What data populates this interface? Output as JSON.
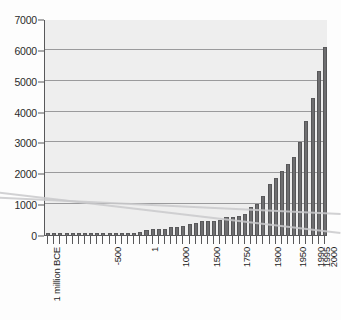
{
  "chart_data": {
    "type": "bar",
    "title": "",
    "subtitle": "",
    "xlabel": "",
    "ylabel": "",
    "ylim": [
      0,
      7000
    ],
    "ytick_labels": [
      "0",
      "1000",
      "2000",
      "3000",
      "4000",
      "5000",
      "6000",
      "7000"
    ],
    "ytick_values": [
      0,
      1000,
      2000,
      3000,
      4000,
      5000,
      6000,
      7000
    ],
    "grid": true,
    "legend": "none",
    "categories": [
      "1 million BCE",
      "",
      "",
      "",
      "",
      "",
      "",
      "",
      "",
      "",
      "-500",
      "",
      "",
      "",
      "",
      "",
      "1",
      "",
      "",
      "",
      "1000",
      "",
      "",
      "",
      "1500",
      "",
      "",
      "",
      "1750",
      "",
      "",
      "",
      "",
      "1900",
      "",
      "",
      "1950",
      "",
      "",
      "",
      "",
      "",
      "",
      "1990",
      "1995",
      "2000"
    ],
    "values": [
      10,
      10,
      10,
      10,
      10,
      12,
      14,
      16,
      20,
      25,
      30,
      40,
      50,
      60,
      70,
      90,
      170,
      190,
      190,
      200,
      250,
      260,
      300,
      360,
      400,
      460,
      460,
      460,
      500,
      580,
      600,
      630,
      690,
      900,
      1000,
      1260,
      1650,
      1860,
      2070,
      2300,
      2520,
      3020,
      3700,
      4450,
      5300,
      6100
    ],
    "labeled_ticks": [
      {
        "index": 0,
        "label": "1 million BCE"
      },
      {
        "index": 10,
        "label": "-500"
      },
      {
        "index": 16,
        "label": "1"
      },
      {
        "index": 21,
        "label": "1000"
      },
      {
        "index": 26,
        "label": "1500"
      },
      {
        "index": 31,
        "label": "1750"
      },
      {
        "index": 36,
        "label": "1900"
      },
      {
        "index": 40,
        "label": "1950"
      },
      {
        "index": 43,
        "label": "1990"
      },
      {
        "index": 44,
        "label": "1995"
      },
      {
        "index": 45,
        "label": "2000"
      }
    ],
    "colors": {
      "bar_fill": "#6e6e70",
      "bar_edge": "#565658",
      "plot_background": "#eeeeee",
      "gridline": "#9a9a9c",
      "axis": "#58585a",
      "text": "#1d1d1d",
      "artifact": "#c9c9cb"
    },
    "artifacts": [
      {
        "name": "scan-line-upper",
        "x1": -14,
        "y1": 190,
        "x2": 341,
        "y2": 232
      },
      {
        "name": "scan-line-lower",
        "x1": -14,
        "y1": 196,
        "x2": 341,
        "y2": 213
      }
    ]
  }
}
